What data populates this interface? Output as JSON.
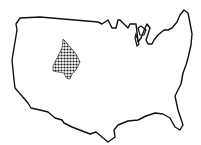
{
  "map": {
    "subject": "United States (contiguous) outline",
    "highlighted_region": {
      "label": "Western interior region (approx. Wyoming/Colorado area)",
      "pattern": "checkered-dots",
      "color": "#1a1a1a"
    },
    "outline_color": "#111111",
    "background_color": "#ffffff"
  }
}
